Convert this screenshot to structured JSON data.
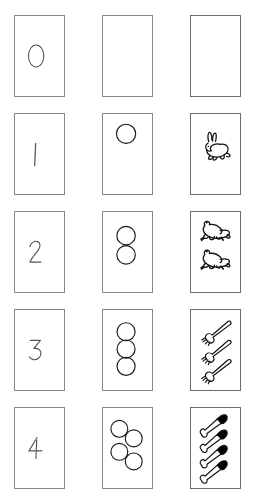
{
  "columns": [
    {
      "name": "numeral-column",
      "label": "Numeral"
    },
    {
      "name": "dots-column",
      "label": "Circles"
    },
    {
      "name": "pictures-column",
      "label": "Pictures"
    }
  ],
  "colors": {
    "background": "#ffffff",
    "card_border_light": "#8a8a8a",
    "card_border_dark": "#6d6d6d",
    "ink": "#555555",
    "outline": "#1a1a1a",
    "fill_black": "#000000"
  },
  "rows": [
    {
      "index": 0,
      "numeral": "0",
      "count": 0,
      "dots_label": "no circles",
      "picture_label": "empty",
      "picture_icon": "empty-card-icon",
      "dots_icon": "zero-circles-icon",
      "numeral_icon": "digit-zero-icon"
    },
    {
      "index": 1,
      "numeral": "1",
      "count": 1,
      "dots_label": "one circle",
      "picture_label": "one rabbit",
      "picture_icon": "rabbit-icon",
      "dots_icon": "one-circle-icon",
      "numeral_icon": "digit-one-icon"
    },
    {
      "index": 2,
      "numeral": "2",
      "count": 2,
      "dots_label": "two circles",
      "picture_label": "two frogs",
      "picture_icon": "frog-icon",
      "dots_icon": "two-circles-icon",
      "numeral_icon": "digit-two-icon"
    },
    {
      "index": 3,
      "numeral": "3",
      "count": 3,
      "dots_label": "three circles",
      "picture_label": "three forks",
      "picture_icon": "fork-icon",
      "dots_icon": "three-circles-icon",
      "numeral_icon": "digit-three-icon"
    },
    {
      "index": 4,
      "numeral": "4",
      "count": 4,
      "dots_label": "four circles",
      "picture_label": "four knives",
      "picture_icon": "knife-icon",
      "dots_icon": "four-circles-icon",
      "numeral_icon": "digit-four-icon"
    }
  ]
}
